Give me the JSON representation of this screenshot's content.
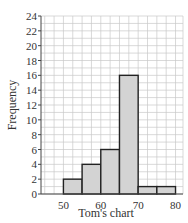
{
  "chart_data": {
    "type": "bar",
    "subtype": "histogram",
    "title": "",
    "xlabel": "Tom's chart",
    "ylabel": "Frequency",
    "bins": [
      [
        50,
        55
      ],
      [
        55,
        60
      ],
      [
        60,
        65
      ],
      [
        65,
        70
      ],
      [
        70,
        75
      ],
      [
        75,
        80
      ]
    ],
    "categories": [
      "50-55",
      "55-60",
      "60-65",
      "65-70",
      "70-75",
      "75-80"
    ],
    "values": [
      2,
      4,
      6,
      16,
      1,
      1
    ],
    "xlim": [
      44,
      82
    ],
    "ylim": [
      0,
      24
    ],
    "xticks": [
      50,
      60,
      70,
      80
    ],
    "yticks": [
      0,
      2,
      4,
      6,
      8,
      10,
      12,
      14,
      16,
      18,
      20,
      22,
      24
    ],
    "grid": true,
    "bar_color": "#d3d3d3",
    "bar_edge_color": "#222222"
  }
}
